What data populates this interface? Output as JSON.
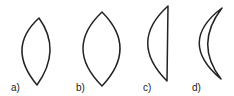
{
  "figure": {
    "stroke_color": "#222222",
    "background": "#ffffff",
    "items": [
      {
        "label": "a)",
        "shape": "biconvex-lens"
      },
      {
        "label": "b)",
        "shape": "biconvex-lens"
      },
      {
        "label": "c)",
        "shape": "plano-convex-lens"
      },
      {
        "label": "d)",
        "shape": "convex-concave-meniscus-lens"
      }
    ]
  }
}
